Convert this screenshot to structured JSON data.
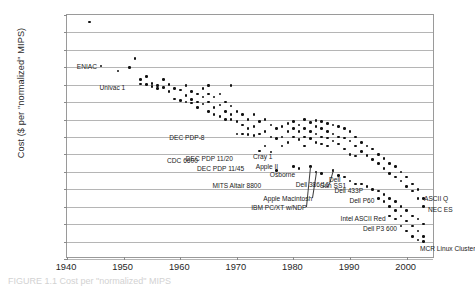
{
  "chart_data": {
    "type": "scatter",
    "title": "",
    "xlabel": "",
    "ylabel": "Cost ($ per \"normalized\" MIPS)",
    "xlim": [
      1940,
      2005
    ],
    "ylim": [
      0.1,
      10000000000000.0
    ],
    "yscale": "log",
    "xscale": "linear",
    "grid": true,
    "legend": "none",
    "xticks": [
      "1940",
      "1950",
      "1960",
      "1970",
      "1980",
      "1990",
      "2000"
    ],
    "xtick_values": [
      1940,
      1950,
      1960,
      1970,
      1980,
      1990,
      2000
    ],
    "yticks": [
      "1E+13",
      "1E+12",
      "1E+11",
      "1E+10",
      "1E+09",
      "1E+08",
      "1E+07",
      "1E+06",
      "100000",
      "10000",
      "1000",
      "100",
      "10",
      "1",
      "0.1"
    ],
    "ytick_values": [
      10000000000000.0,
      1000000000000.0,
      100000000000.0,
      10000000000.0,
      1000000000.0,
      100000000.0,
      10000000.0,
      1000000.0,
      100000.0,
      10000.0,
      1000.0,
      100,
      10,
      1,
      0.1
    ],
    "points": [
      [
        1944,
        4000000000000.0
      ],
      [
        1946,
        12000000000.0
      ],
      [
        1949,
        6000000000.0
      ],
      [
        1951,
        10000000000.0
      ],
      [
        1952,
        32000000000.0
      ],
      [
        1953,
        2000000000.0
      ],
      [
        1953,
        1100000000.0
      ],
      [
        1954,
        3000000000.0
      ],
      [
        1954,
        1000000000.0
      ],
      [
        1955,
        1200000000.0
      ],
      [
        1955,
        800000000.0
      ],
      [
        1956,
        900000000.0
      ],
      [
        1956,
        600000000.0
      ],
      [
        1957,
        2000000000.0
      ],
      [
        1957,
        700000000.0
      ],
      [
        1958,
        400000000.0
      ],
      [
        1958,
        1000000000.0
      ],
      [
        1959,
        600000000.0
      ],
      [
        1959,
        150000000.0
      ],
      [
        1960,
        500000000.0
      ],
      [
        1960,
        120000000.0
      ],
      [
        1961,
        900000000.0
      ],
      [
        1961,
        250000000.0
      ],
      [
        1961,
        100000000.0
      ],
      [
        1962,
        400000000.0
      ],
      [
        1962,
        140000000.0
      ],
      [
        1962,
        90000000.0
      ],
      [
        1963,
        300000000.0
      ],
      [
        1963,
        100000000.0
      ],
      [
        1963,
        50000000.0
      ],
      [
        1964,
        600000000.0
      ],
      [
        1964,
        200000000.0
      ],
      [
        1964,
        80000000.0
      ],
      [
        1965,
        900000000.0
      ],
      [
        1965,
        300000000.0
      ],
      [
        1965,
        100000000.0
      ],
      [
        1965,
        30000000.0
      ],
      [
        1966,
        200000000.0
      ],
      [
        1966,
        50000000.0
      ],
      [
        1966,
        20000000.0
      ],
      [
        1967,
        300000000.0
      ],
      [
        1967,
        70000000.0
      ],
      [
        1967,
        15000000.0
      ],
      [
        1968,
        100000000.0
      ],
      [
        1968,
        30000000.0
      ],
      [
        1968,
        10000000.0
      ],
      [
        1969,
        900000000.0
      ],
      [
        1969,
        60000000.0
      ],
      [
        1969,
        20000000.0
      ],
      [
        1969,
        10000000.0
      ],
      [
        1970,
        30000000.0
      ],
      [
        1970,
        8000000.0
      ],
      [
        1970,
        1500000.0
      ],
      [
        1971,
        20000000.0
      ],
      [
        1971,
        5000000.0
      ],
      [
        1971,
        1500000.0
      ],
      [
        1972,
        10000000.0
      ],
      [
        1972,
        3000000.0
      ],
      [
        1972,
        1400000.0
      ],
      [
        1973,
        20000000.0
      ],
      [
        1973,
        4000000.0
      ],
      [
        1973,
        1200000.0
      ],
      [
        1974,
        8000000.0
      ],
      [
        1974,
        1500000.0
      ],
      [
        1974,
        160000.0
      ],
      [
        1975,
        10000000.0
      ],
      [
        1975,
        2000000.0
      ],
      [
        1975,
        300000.0
      ],
      [
        1976,
        5000000.0
      ],
      [
        1976,
        1000000.0
      ],
      [
        1976,
        140000.0
      ],
      [
        1977,
        3000000.0
      ],
      [
        1977,
        800000.0
      ],
      [
        1977,
        12000.0
      ],
      [
        1978,
        4000000.0
      ],
      [
        1978,
        1000000.0
      ],
      [
        1978,
        300000.0
      ],
      [
        1979,
        6000000.0
      ],
      [
        1979,
        2000000.0
      ],
      [
        1979,
        500000.0
      ],
      [
        1980,
        8000000.0
      ],
      [
        1980,
        3000000.0
      ],
      [
        1980,
        1000000.0
      ],
      [
        1980,
        20000.0
      ],
      [
        1981,
        5000000.0
      ],
      [
        1981,
        2000000.0
      ],
      [
        1981,
        700000.0
      ],
      [
        1981,
        15000.0
      ],
      [
        1982,
        10000000.0
      ],
      [
        1982,
        3000000.0
      ],
      [
        1982,
        1000000.0
      ],
      [
        1982,
        300000.0
      ],
      [
        1983,
        7000000.0
      ],
      [
        1983,
        2000000.0
      ],
      [
        1983,
        800000.0
      ],
      [
        1983,
        20000.0
      ],
      [
        1984,
        9000000.0
      ],
      [
        1984,
        4000000.0
      ],
      [
        1984,
        1500000.0
      ],
      [
        1984,
        500000.0
      ],
      [
        1984,
        10000.0
      ],
      [
        1985,
        8000000.0
      ],
      [
        1985,
        3000000.0
      ],
      [
        1985,
        1000000.0
      ],
      [
        1985,
        400000.0
      ],
      [
        1985,
        8000.0
      ],
      [
        1986,
        6000000.0
      ],
      [
        1986,
        2000000.0
      ],
      [
        1986,
        900000.0
      ],
      [
        1986,
        300000.0
      ],
      [
        1987,
        5000000.0
      ],
      [
        1987,
        1500000.0
      ],
      [
        1987,
        600000.0
      ],
      [
        1987,
        12000.0
      ],
      [
        1988,
        4000000.0
      ],
      [
        1988,
        1000000.0
      ],
      [
        1988,
        400000.0
      ],
      [
        1988,
        6000.0
      ],
      [
        1989,
        3000000.0
      ],
      [
        1989,
        900000.0
      ],
      [
        1989,
        200000.0
      ],
      [
        1989,
        5000.0
      ],
      [
        1990,
        2000000.0
      ],
      [
        1990,
        600000.0
      ],
      [
        1990,
        100000.0
      ],
      [
        1990,
        3000.0
      ],
      [
        1991,
        1000000.0
      ],
      [
        1991,
        300000.0
      ],
      [
        1991,
        80000.0
      ],
      [
        1991,
        2000.0
      ],
      [
        1992,
        500000.0
      ],
      [
        1992,
        150000.0
      ],
      [
        1992,
        2000.0
      ],
      [
        1993,
        300000.0
      ],
      [
        1993,
        90000.0
      ],
      [
        1993,
        1500.0
      ],
      [
        1994,
        200000.0
      ],
      [
        1994,
        50000.0
      ],
      [
        1994,
        1000.0
      ],
      [
        1995,
        100000.0
      ],
      [
        1995,
        30000.0
      ],
      [
        1995,
        800.0
      ],
      [
        1995,
        300.0
      ],
      [
        1996,
        60000.0
      ],
      [
        1996,
        15000.0
      ],
      [
        1996,
        500.0
      ],
      [
        1996,
        200.0
      ],
      [
        1997,
        30000.0
      ],
      [
        1997,
        8000.0
      ],
      [
        1997,
        300.0
      ],
      [
        1997,
        100.0
      ],
      [
        1997,
        30.0
      ],
      [
        1998,
        20000.0
      ],
      [
        1998,
        5000.0
      ],
      [
        1998,
        200.0
      ],
      [
        1998,
        60.0
      ],
      [
        1998,
        20.0
      ],
      [
        1999,
        10000.0
      ],
      [
        1999,
        3000.0
      ],
      [
        1999,
        100.0
      ],
      [
        1999,
        30.0
      ],
      [
        1999,
        8.0
      ],
      [
        2000,
        5000.0
      ],
      [
        2000,
        1500.0
      ],
      [
        2000,
        60.0
      ],
      [
        2000,
        15.0
      ],
      [
        2000,
        4.0
      ],
      [
        2001,
        2000.0
      ],
      [
        2001,
        800.0
      ],
      [
        2001,
        30.0
      ],
      [
        2001,
        8.0
      ],
      [
        2001,
        2.0
      ],
      [
        2002,
        1000.0
      ],
      [
        2002,
        300.0
      ],
      [
        2002,
        20.0
      ],
      [
        2002,
        4.0
      ],
      [
        2002,
        1.2
      ],
      [
        2003,
        300.0
      ],
      [
        2003,
        100.0
      ],
      [
        2003,
        10.0
      ],
      [
        2003,
        2.0
      ],
      [
        2003,
        1.0
      ]
    ],
    "annotations": [
      {
        "label": "ENIAC",
        "year": 1946,
        "value": 12000000000.0,
        "align": "right",
        "dx": -4,
        "dy": 0,
        "leader": false
      },
      {
        "label": "Univac 1",
        "year": 1951,
        "value": 1000000000.0,
        "align": "right",
        "dx": -4,
        "dy": 2,
        "leader": false
      },
      {
        "label": "DEC PDP-8",
        "year": 1965,
        "value": 1000000.0,
        "align": "right",
        "dx": -4,
        "dy": 0,
        "leader": false
      },
      {
        "label": "CDC 6600",
        "year": 1964,
        "value": 100000.0,
        "align": "right",
        "dx": -5,
        "dy": 6,
        "leader": false
      },
      {
        "label": "DEC PDP 11/20",
        "year": 1970,
        "value": 100000.0,
        "align": "right",
        "dx": -4,
        "dy": 4,
        "leader": false
      },
      {
        "label": "DEC PDP 11/45",
        "year": 1972,
        "value": 30000.0,
        "align": "right",
        "dx": -4,
        "dy": 4,
        "leader": false
      },
      {
        "label": "MITS Altair 8800",
        "year": 1975,
        "value": 3000.0,
        "align": "right",
        "dx": -4,
        "dy": 4,
        "leader": false
      },
      {
        "label": "Cray 1",
        "year": 1977,
        "value": 100000.0,
        "align": "right",
        "dx": -4,
        "dy": 2,
        "leader": false
      },
      {
        "label": "Apple II",
        "year": 1978,
        "value": 30000.0,
        "align": "right",
        "dx": -4,
        "dy": 2,
        "leader": false
      },
      {
        "label": "Osborne",
        "year": 1981,
        "value": 10000.0,
        "align": "right",
        "dx": -4,
        "dy": 2,
        "leader": false
      },
      {
        "label": "Apple Macintosh",
        "year": 1984,
        "value": 10000.0,
        "align": "right",
        "dx": -4,
        "dy": 26,
        "leader": true
      },
      {
        "label": "IBM PC/XT w/NDP",
        "year": 1983,
        "value": 20000.0,
        "align": "right",
        "dx": -4,
        "dy": 40,
        "leader": true
      },
      {
        "label": "Dell 386/16",
        "year": 1987,
        "value": 12000.0,
        "align": "right",
        "dx": -4,
        "dy": 14,
        "leader": true
      },
      {
        "label": "Dell",
        "year": 1989,
        "value": 5000.0,
        "align": "right",
        "dx": -4,
        "dy": 2,
        "leader": false
      },
      {
        "label": "Sun SS1",
        "year": 1990,
        "value": 3000.0,
        "align": "right",
        "dx": -4,
        "dy": 4,
        "leader": false
      },
      {
        "label": "Dell 433P",
        "year": 1993,
        "value": 1500.0,
        "align": "right",
        "dx": -4,
        "dy": 4,
        "leader": false
      },
      {
        "label": "Dell  P60",
        "year": 1995,
        "value": 300.0,
        "align": "right",
        "dx": -4,
        "dy": 2,
        "leader": false
      },
      {
        "label": "Intel ASCII Red",
        "year": 1997,
        "value": 30.0,
        "align": "right",
        "dx": -4,
        "dy": 2,
        "leader": false
      },
      {
        "label": "Dell P3 600",
        "year": 1999,
        "value": 8.0,
        "align": "right",
        "dx": -4,
        "dy": 2,
        "leader": false
      },
      {
        "label": "ASCII Q",
        "year": 2002,
        "value": 300.0,
        "align": "left",
        "dx": 6,
        "dy": 0,
        "leader": false
      },
      {
        "label": "NEC ES",
        "year": 2002,
        "value": 100.0,
        "align": "left",
        "dx": 10,
        "dy": 2,
        "leader": false
      },
      {
        "label": "MCR Linux Cluster",
        "year": 2002,
        "value": 1.0,
        "align": "left",
        "dx": 2,
        "dy": 6,
        "leader": false
      }
    ]
  },
  "caption": {
    "text": "FIGURE 1.1 Cost per \"normalized\" MIPS"
  }
}
